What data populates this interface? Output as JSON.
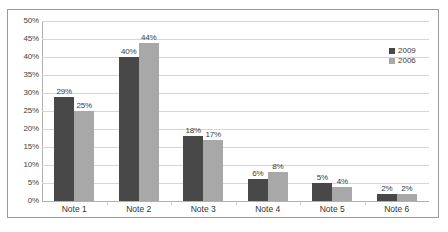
{
  "chart_data": {
    "type": "bar",
    "title": "",
    "xlabel": "",
    "ylabel": "",
    "categories": [
      "Note 1",
      "Note 2",
      "Note 3",
      "Note 4",
      "Note 5",
      "Note 6"
    ],
    "series": [
      {
        "name": "2009",
        "color": "#484848",
        "values": [
          29,
          40,
          18,
          6,
          5,
          2
        ],
        "labels": [
          "29%",
          "40%",
          "18%",
          "6%",
          "5%",
          "2%"
        ]
      },
      {
        "name": "2006",
        "color": "#a8a8a8",
        "values": [
          25,
          44,
          17,
          8,
          4,
          2
        ],
        "labels": [
          "25%",
          "44%",
          "17%",
          "8%",
          "4%",
          "2%"
        ]
      }
    ],
    "ylim": [
      0,
      50
    ],
    "y_ticks": [
      50,
      45,
      40,
      35,
      30,
      25,
      20,
      15,
      10,
      5,
      0
    ],
    "y_tick_labels": [
      "50%",
      "45%",
      "40%",
      "35%",
      "30%",
      "25%",
      "20%",
      "15%",
      "10%",
      "5%",
      "0%"
    ],
    "grid": true,
    "legend_position": "top-right"
  }
}
